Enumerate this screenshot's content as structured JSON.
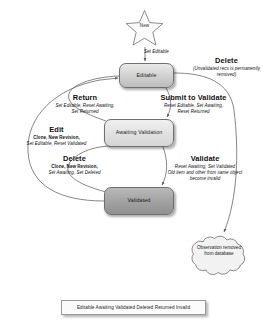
{
  "diagram": {
    "colors": {
      "edge": "#5f5f5f",
      "node_border": "#6f6f6f",
      "node_fill_light": "#d2d2d2",
      "node_fill_dark": "#a3a3a3",
      "text": "#101010",
      "background": "#ffffff"
    },
    "nodes": [
      {
        "id": "start",
        "label": "New",
        "shape": "star"
      },
      {
        "id": "editable",
        "label": "Editable",
        "shape": "rounded-rect"
      },
      {
        "id": "awaiting",
        "label": "Awaiting Validation",
        "shape": "rounded-rect"
      },
      {
        "id": "validated",
        "label": "Validated",
        "shape": "rounded-rect"
      },
      {
        "id": "removed",
        "label": "Observation removed from database",
        "shape": "cloud"
      }
    ],
    "transitions": [
      {
        "id": "set-editable",
        "from": "start",
        "to": "editable",
        "title": "",
        "actions": "Set Editable"
      },
      {
        "id": "delete-editable",
        "from": "editable",
        "to": "removed",
        "title": "Delete",
        "actions": "(Unvalidated recs is permanently removed)"
      },
      {
        "id": "return",
        "from": "awaiting",
        "to": "editable",
        "title": "Return",
        "actions_line1": "Set Editable, Reset Awaiting,",
        "actions_line2": "Set Returned"
      },
      {
        "id": "submit-to-validate",
        "from": "editable",
        "to": "awaiting",
        "title": "Submit to Validate",
        "actions_line1": "Reset Editable, Set Awaiting,",
        "actions_line2": "Reset Returned"
      },
      {
        "id": "edit",
        "from": "validated",
        "to": "editable",
        "title": "Edit",
        "actions_line1": "Clone, New Revision,",
        "actions_line2": "Set Editable, Reset Validated"
      },
      {
        "id": "delete-validated",
        "from": "validated",
        "to": "awaiting",
        "title": "Delete",
        "actions_line1": "Clone, New Revision,",
        "actions_line2": "Set Awaiting, Set Deleted"
      },
      {
        "id": "validate",
        "from": "awaiting",
        "to": "validated",
        "title": "Validate",
        "actions_line1": "Reset Awaiting, Set Validated",
        "actions_line2": "Old item and other from same object",
        "actions_line3": "become invalid"
      }
    ],
    "legend": {
      "text": "Editable Awaiting Validated Deleted Returned Invalid"
    }
  }
}
